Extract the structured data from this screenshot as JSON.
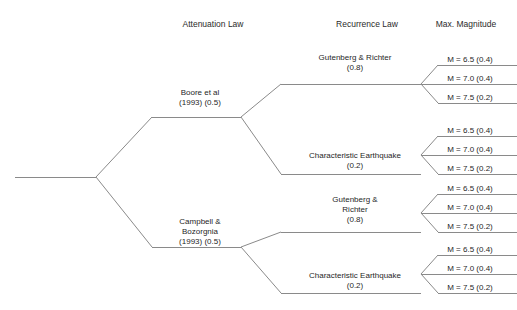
{
  "diagram": {
    "type": "logic-tree",
    "line_color": "#8a8a8a",
    "background": "#ffffff",
    "headers": [
      {
        "label": "Attenuation Law",
        "x": 213
      },
      {
        "label": "Recurrence Law",
        "x": 367
      },
      {
        "label": "Max. Magnitude",
        "x": 466
      }
    ],
    "attenuation_nodes": [
      {
        "id": "boore",
        "lines": [
          "Boore et al",
          "(1993) (0.5)"
        ],
        "weight": "0.5",
        "label_x": 200,
        "label_y": 95,
        "branch_y": 117
      },
      {
        "id": "campbell",
        "lines": [
          "Campbell &",
          "Bozorgnia",
          "(1993) (0.5)"
        ],
        "weight": "0.5",
        "label_x": 200,
        "label_y": 224,
        "branch_y": 247
      }
    ],
    "recurrence_nodes": [
      {
        "id": "gr-1",
        "parent": "boore",
        "lines": [
          "Gutenberg & Richter",
          "(0.8)"
        ],
        "weight": "0.8",
        "label_x": 355,
        "label_y": 60,
        "branch_y": 84
      },
      {
        "id": "ce-1",
        "parent": "boore",
        "lines": [
          "Characteristic Earthquake",
          "(0.2)"
        ],
        "weight": "0.2",
        "label_x": 355,
        "label_y": 158,
        "branch_y": 174
      },
      {
        "id": "gr-2",
        "parent": "campbell",
        "lines": [
          "Gutenberg &",
          "Richter",
          "(0.8)"
        ],
        "weight": "0.8",
        "label_x": 355,
        "label_y": 202,
        "branch_y": 232
      },
      {
        "id": "ce-2",
        "parent": "campbell",
        "lines": [
          "Characteristic Earthquake",
          "(0.2)"
        ],
        "weight": "0.2",
        "label_x": 355,
        "label_y": 278,
        "branch_y": 293
      }
    ],
    "magnitude_leaves": [
      {
        "label": "M = 6.5 (0.4)",
        "magnitude": "6.5",
        "weight": "0.4"
      },
      {
        "label": "M = 7.0 (0.4)",
        "magnitude": "7.0",
        "weight": "0.4"
      },
      {
        "label": "M = 7.5 (0.2)",
        "magnitude": "7.5",
        "weight": "0.2"
      }
    ],
    "leaf_groups": [
      {
        "parent": "gr-1",
        "fan_x": 421,
        "fan_y": 84,
        "leaf_ys": [
          65,
          84,
          103
        ]
      },
      {
        "parent": "ce-1",
        "fan_x": 421,
        "fan_y": 155,
        "leaf_ys": [
          136,
          155,
          174
        ]
      },
      {
        "parent": "gr-2",
        "fan_x": 421,
        "fan_y": 213,
        "leaf_ys": [
          194,
          213,
          232
        ]
      },
      {
        "parent": "ce-2",
        "fan_x": 421,
        "fan_y": 274,
        "leaf_ys": [
          255,
          274,
          293
        ]
      }
    ],
    "root": {
      "trunk_x_start": 15,
      "trunk_x_end": 96,
      "trunk_y": 177
    }
  }
}
